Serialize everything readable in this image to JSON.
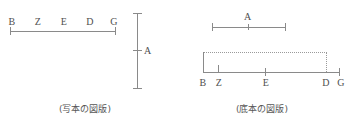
{
  "figure": {
    "type": "geometric-diagram-pair",
    "colors": {
      "line": "#8a8a8a",
      "dotted": "#9a9a9a",
      "text": "#4f4f4f",
      "background": "#ffffff"
    },
    "panels": [
      {
        "id": "manuscript",
        "caption": "(写本の図版)",
        "segment_labels": [
          "B",
          "Z",
          "E",
          "D",
          "G"
        ],
        "vertical_label": "A",
        "description": "horizontal segment BZEDG with a separate vertical segment A at right"
      },
      {
        "id": "base-text",
        "caption": "(底本の図版)",
        "upper_segment_label": "A",
        "baseline_labels": [
          "B",
          "Z",
          "E",
          "D",
          "G"
        ],
        "description": "upper segment A above a baseline BZEDG closed by a dotted rectangle from B to D"
      }
    ]
  }
}
